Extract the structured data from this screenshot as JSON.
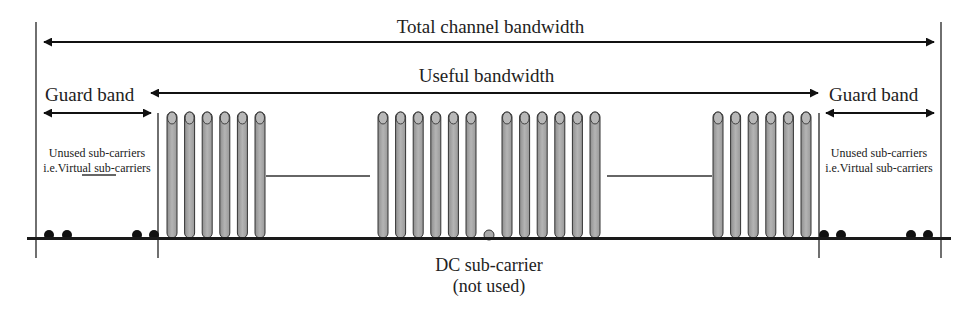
{
  "diagram": {
    "labels": {
      "total_bandwidth": "Total channel bandwidth",
      "useful_bandwidth": "Useful bandwidth",
      "guard_band_left": "Guard band",
      "guard_band_right": "Guard band",
      "unused_left_line1": "Unused sub-carriers",
      "unused_left_line2": "i.e.Virtual sub-carriers",
      "unused_right_line1": "Unused sub-carriers",
      "unused_right_line2": "i.e.Virtual sub-carriers",
      "dc_line1": "DC sub-carrier",
      "dc_line2": "(not used)"
    },
    "groups": [
      {
        "name": "left-used-group",
        "bars": 6
      },
      {
        "name": "center-left-group",
        "bars": 6
      },
      {
        "name": "dc-subcarrier",
        "bars": 0,
        "dot": true
      },
      {
        "name": "center-right-group",
        "bars": 6
      },
      {
        "name": "right-used-group",
        "bars": 6
      }
    ],
    "virtual_subcarriers": {
      "left": 4,
      "right": 4
    },
    "colors": {
      "bar_fill": "#a8a8a8",
      "bar_stroke": "#333333",
      "baseline": "#1a1a1a",
      "dot": "#111111"
    }
  }
}
